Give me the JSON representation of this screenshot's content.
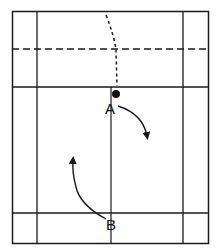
{
  "diagram": {
    "labels": {
      "player_a": "A",
      "player_b": "B"
    },
    "colors": {
      "line": "#1a1a1a",
      "background": "#ffffff"
    },
    "elements": [
      {
        "id": "court-boundary",
        "type": "rectangle"
      },
      {
        "id": "left-singles-sideline",
        "type": "line"
      },
      {
        "id": "right-singles-sideline",
        "type": "line"
      },
      {
        "id": "net-dashed-line",
        "type": "dashed-line"
      },
      {
        "id": "short-service-line",
        "type": "line"
      },
      {
        "id": "back-service-line",
        "type": "line"
      },
      {
        "id": "center-line",
        "type": "line"
      },
      {
        "id": "shuttle-trajectory",
        "type": "dotted-curve"
      },
      {
        "id": "shuttlecock",
        "type": "dot"
      },
      {
        "id": "player-a-movement-arrow",
        "type": "curved-arrow"
      },
      {
        "id": "player-b-movement-arrow",
        "type": "curved-arrow"
      }
    ]
  }
}
